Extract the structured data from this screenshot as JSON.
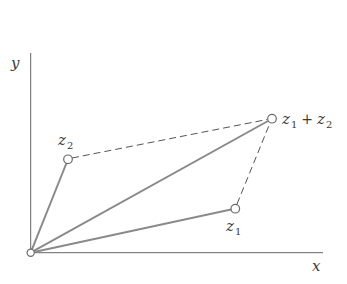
{
  "diagram": {
    "type": "vector-addition-parallelogram",
    "axes": {
      "x_label": "x",
      "y_label": "y",
      "origin": [
        30.7,
        252.7
      ],
      "x_end": [
        323,
        252.7
      ],
      "y_end": [
        30.7,
        53
      ]
    },
    "points": {
      "origin": {
        "label": "",
        "pos": [
          30.7,
          252.7
        ]
      },
      "z1": {
        "label_main": "z",
        "label_sub": "1",
        "pos": [
          235.3,
          208.7
        ]
      },
      "z2": {
        "label_main": "z",
        "label_sub": "2",
        "pos": [
          68,
          159.3
        ]
      },
      "sum": {
        "label_a_main": "z",
        "label_a_sub": "1",
        "operator": "+",
        "label_b_main": "z",
        "label_b_sub": "2",
        "pos": [
          272,
          118.7
        ]
      }
    },
    "solid_vectors": [
      "origin->z1",
      "origin->z2",
      "origin->sum"
    ],
    "dashed_lines": [
      "z2->sum",
      "z1->sum"
    ],
    "colors": {
      "axis": "#555555",
      "vector": "#8a8a8a",
      "dashed": "#555555",
      "point_stroke": "#6a6a6a",
      "point_fill": "#ffffff",
      "text": "#3a3a3a"
    }
  }
}
